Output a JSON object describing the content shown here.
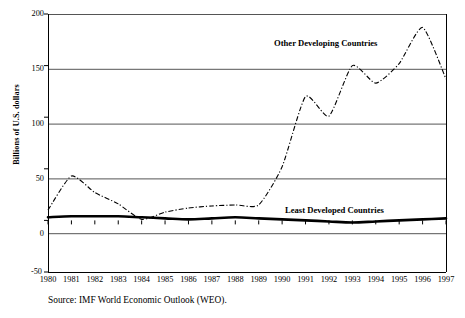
{
  "chart_data": {
    "type": "line",
    "title": "",
    "xlabel": "",
    "ylabel": "Billions of U.S. dollars",
    "x": [
      1980,
      1981,
      1982,
      1983,
      1984,
      1985,
      1986,
      1987,
      1988,
      1989,
      1990,
      1991,
      1992,
      1993,
      1994,
      1995,
      1996,
      1997
    ],
    "categories": [
      "1980",
      "1981",
      "1982",
      "1983",
      "1984",
      "1985",
      "1986",
      "1987",
      "1988",
      "1989",
      "1990",
      "1991",
      "1992",
      "1993",
      "1994",
      "1995",
      "1996",
      "1997"
    ],
    "ylim": [
      -50,
      200
    ],
    "xlim": [
      1980,
      1997
    ],
    "yticks": [
      -50,
      0,
      50,
      100,
      150,
      200
    ],
    "ytick_labels": [
      "-50",
      "0",
      "50",
      "100",
      "150",
      "200"
    ],
    "grid": "horizontal",
    "legend_position": "inline-annotations",
    "series": [
      {
        "name": "Other Developing Countries",
        "style": "dash-dot",
        "color": "#000000",
        "values": [
          10,
          43,
          27,
          16,
          1,
          8,
          12,
          14,
          15,
          15,
          52,
          120,
          101,
          150,
          133,
          152,
          187,
          137
        ]
      },
      {
        "name": "Least Developed Countries",
        "style": "solid-bold",
        "color": "#000000",
        "values": [
          3,
          4,
          4,
          4,
          3,
          2,
          1,
          2,
          3,
          2,
          1,
          0,
          -1,
          -2,
          -1,
          0,
          1,
          2
        ]
      }
    ],
    "annotations": [
      {
        "text": "Other Developing Countries",
        "x": 1991.5,
        "y": 175
      },
      {
        "text": "Least Developed Countries",
        "x": 1992,
        "y": 18
      }
    ]
  },
  "axes": {
    "ylabel": "Billions of U.S. dollars",
    "ytick_labels": [
      "200",
      "150",
      "100",
      "50",
      "0",
      "-50"
    ],
    "xtick_labels": [
      "1980",
      "1981",
      "1982",
      "1983",
      "1984",
      "1985",
      "1986",
      "1987",
      "1988",
      "1989",
      "1990",
      "1991",
      "1992",
      "1993",
      "1994",
      "1995",
      "1996",
      "1997"
    ]
  },
  "labels": {
    "other_developing": "Other Developing Countries",
    "least_developed": "Least Developed Countries"
  },
  "footer": {
    "source": "Source: IMF World Economic Outlook (WEO)."
  },
  "colors": {
    "line": "#000000",
    "grid": "#555555",
    "frame": "#000000",
    "background": "#ffffff"
  }
}
